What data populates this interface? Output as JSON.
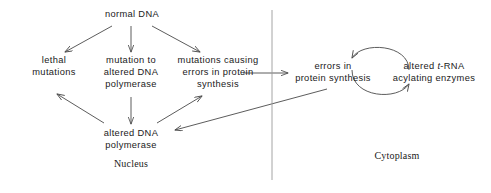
{
  "diagram": {
    "line_color": "#4a4a4a",
    "text_color": "#1a1a1a",
    "divider_color": "#9a9a9a",
    "nodes": {
      "normal_dna": {
        "lines": [
          "normal  DNA"
        ]
      },
      "lethal_mutations": {
        "lines": [
          "lethal",
          "mutations"
        ]
      },
      "mutation_polymerase": {
        "lines": [
          "mutation to",
          "altered DNA",
          "polymerase"
        ]
      },
      "mutations_errors": {
        "lines": [
          "mutations causing",
          "errors in protein",
          "synthesis"
        ]
      },
      "altered_polymerase": {
        "lines": [
          "altered  DNA",
          "polymerase"
        ]
      },
      "errors_protein": {
        "lines": [
          "errors in",
          "protein  synthesis"
        ]
      },
      "trna_enzymes": {
        "line1_pre": "altered ",
        "line1_ital": "t",
        "line1_post": "-RNA",
        "line2": "acylating  enzymes"
      }
    },
    "compartments": {
      "nucleus": "Nucleus",
      "cytoplasm": "Cytoplasm"
    }
  }
}
